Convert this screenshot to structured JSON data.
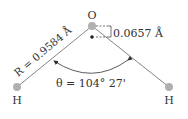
{
  "diagram": {
    "atoms": {
      "oxygen": {
        "label": "O",
        "color": "#b0b0b0"
      },
      "hydrogen_left": {
        "label": "H",
        "color": "#b0b0b0"
      },
      "hydrogen_right": {
        "label": "H",
        "color": "#b0b0b0"
      }
    },
    "bond_length": {
      "symbol": "R",
      "text": "R = 0.9584 Å"
    },
    "offset": {
      "text": "0.0657 Å"
    },
    "bond_angle": {
      "symbol": "θ",
      "text": "θ = 104° 27'"
    },
    "colors": {
      "line": "#555555",
      "atom": "#b0b0b0",
      "center_dot": "#222222",
      "text": "#333333"
    }
  }
}
